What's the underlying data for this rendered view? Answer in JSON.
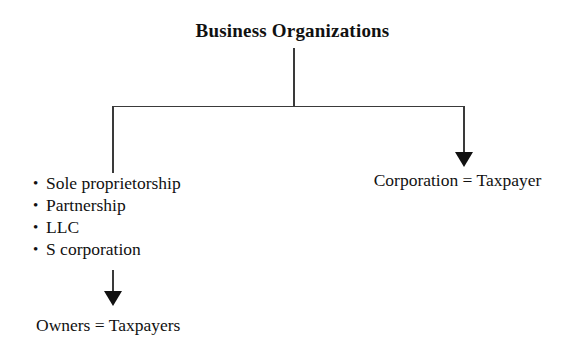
{
  "diagram": {
    "title": "Business Organizations",
    "background_color": "#ffffff",
    "line_color": "#3a3a3a",
    "text_color": "#111111",
    "nodes": {
      "root": {
        "label": "Business Organizations"
      },
      "left_branch": {
        "bullet_glyph": "•",
        "items": [
          "Sole proprietorship",
          "Partnership",
          "LLC",
          "S corporation"
        ],
        "result_label": "Owners = Taxpayers"
      },
      "right_branch": {
        "label": "Corporation = Taxpayer"
      }
    }
  }
}
